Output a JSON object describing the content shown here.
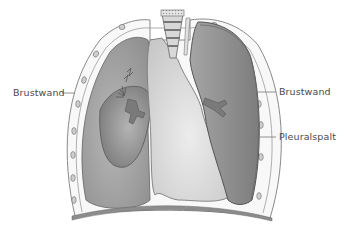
{
  "labels": {
    "left_chest_wall": "Brustwand",
    "right_chest_wall": "Brustwand",
    "pleural_gap": "Pleuralspalt"
  },
  "colors": {
    "background": "#ffffff",
    "chest_wall_fill": "#f7f7f7",
    "chest_wall_stroke": "#8a8a8a",
    "rib_fill": "#c8c8c8",
    "collapsed_lung_cavity": "#a9a9a9",
    "collapsed_lung": "#8e8e8e",
    "heart_mediastinum": "#d6d6d6",
    "healthy_lung": "#9a9a9a",
    "pleural_gap_fill": "#7f7f7f",
    "diaphragm": "#8c8c8c",
    "label_text": "#4a4a4a",
    "leader_line": "#777777"
  }
}
